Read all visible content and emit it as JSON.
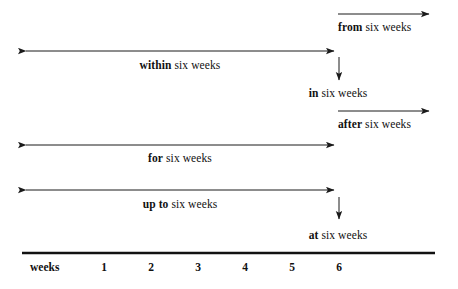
{
  "figure": {
    "type": "timeline-preposition-diagram",
    "background_color": "#ffffff",
    "line_color": "#1a1a1a",
    "text_color": "#111111"
  },
  "axis": {
    "label": "weeks",
    "ticks": [
      "1",
      "2",
      "3",
      "4",
      "5",
      "6"
    ],
    "line_start_x": 22,
    "line_end_x": 435,
    "line_y": 253,
    "tick_positions_x": [
      104,
      151,
      198,
      245,
      292,
      339
    ]
  },
  "spans": [
    {
      "id": "from-six-weeks",
      "keyword": "from",
      "rest": " six weeks",
      "direction": "right-open",
      "arrow_y": 14,
      "x_start": 338,
      "x_end": 433,
      "label_x": 338,
      "label_y": 22,
      "label_align": "left"
    },
    {
      "id": "within-six-weeks",
      "keyword": "within",
      "rest": " six weeks",
      "direction": "double",
      "arrow_y": 51,
      "x_start": 22,
      "x_end": 338,
      "label_x": 180,
      "label_y": 60,
      "label_align": "center"
    },
    {
      "id": "in-six-weeks",
      "keyword": "in",
      "rest": " six weeks",
      "direction": "down-point",
      "arrow_x": 339,
      "y_start": 57,
      "y_end": 84,
      "label_x": 338,
      "label_y": 88,
      "label_align": "center"
    },
    {
      "id": "after-six-weeks",
      "keyword": "after",
      "rest": " six weeks",
      "direction": "right-open",
      "arrow_y": 111,
      "x_start": 338,
      "x_end": 433,
      "label_x": 338,
      "label_y": 119,
      "label_align": "left"
    },
    {
      "id": "for-six-weeks",
      "keyword": "for",
      "rest": " six weeks",
      "direction": "double",
      "arrow_y": 145,
      "x_start": 22,
      "x_end": 338,
      "label_x": 180,
      "label_y": 153,
      "label_align": "center"
    },
    {
      "id": "up-to-six-weeks",
      "keyword": "up to",
      "rest": " six weeks",
      "direction": "double",
      "arrow_y": 190,
      "x_start": 22,
      "x_end": 338,
      "label_x": 180,
      "label_y": 199,
      "label_align": "center"
    },
    {
      "id": "at-six-weeks",
      "keyword": "at",
      "rest": " six weeks",
      "direction": "down-point",
      "arrow_x": 339,
      "y_start": 197,
      "y_end": 223,
      "label_x": 338,
      "label_y": 230,
      "label_align": "center"
    }
  ]
}
